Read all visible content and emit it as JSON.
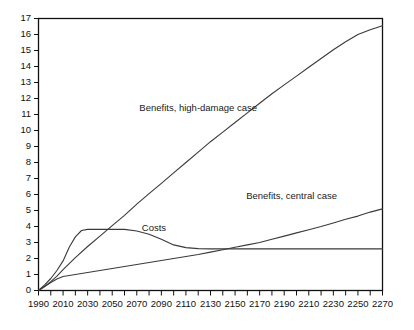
{
  "chart_data": {
    "type": "line",
    "title": "",
    "xlabel": "",
    "ylabel": "",
    "xlim": [
      1990,
      2270
    ],
    "ylim": [
      0,
      17
    ],
    "grid": false,
    "legend_position": "inline-annotations",
    "y_ticks": [
      0,
      1,
      2,
      3,
      4,
      5,
      6,
      7,
      8,
      9,
      10,
      11,
      12,
      13,
      14,
      15,
      16,
      17
    ],
    "y_tick_labels": [
      "0",
      "1",
      "2",
      "3",
      "4",
      "5",
      "6",
      "7",
      "8",
      "9",
      "10",
      "11",
      "12",
      "13",
      "14",
      "15",
      "16",
      "17"
    ],
    "x_ticks": [
      1990,
      2000,
      2010,
      2020,
      2030,
      2040,
      2050,
      2060,
      2070,
      2080,
      2090,
      2100,
      2110,
      2120,
      2130,
      2140,
      2150,
      2160,
      2170,
      2180,
      2190,
      2200,
      2210,
      2220,
      2230,
      2240,
      2250,
      2260,
      2270
    ],
    "x_tick_labels_shown": [
      "1990",
      "2010",
      "2030",
      "2050",
      "2070",
      "2090",
      "2110",
      "2130",
      "2150",
      "2170",
      "2190",
      "2210",
      "2230",
      "2250",
      "2270"
    ],
    "x_labeled_ticks": [
      1990,
      2010,
      2030,
      2050,
      2070,
      2090,
      2110,
      2130,
      2150,
      2170,
      2190,
      2210,
      2230,
      2250,
      2270
    ],
    "series": [
      {
        "name": "Benefits, high-damage case",
        "label_text": "Benefits, high-damage case",
        "label_x": 2120,
        "label_y": 11.2,
        "color": "#3a3a3a",
        "x": [
          1990,
          1995,
          2000,
          2005,
          2010,
          2020,
          2030,
          2040,
          2050,
          2060,
          2070,
          2080,
          2090,
          2100,
          2110,
          2120,
          2130,
          2140,
          2150,
          2160,
          2170,
          2180,
          2190,
          2200,
          2210,
          2220,
          2230,
          2240,
          2250,
          2260,
          2270
        ],
        "y": [
          0.0,
          0.25,
          0.55,
          0.9,
          1.3,
          2.05,
          2.75,
          3.4,
          4.05,
          4.7,
          5.4,
          6.05,
          6.7,
          7.35,
          8.0,
          8.65,
          9.3,
          9.9,
          10.5,
          11.1,
          11.7,
          12.3,
          12.85,
          13.4,
          13.95,
          14.5,
          15.05,
          15.55,
          16.0,
          16.3,
          16.55
        ]
      },
      {
        "name": "Costs",
        "label_text": "Costs",
        "label_x": 2084,
        "label_y": 3.75,
        "color": "#3a3a3a",
        "x": [
          1990,
          1995,
          2000,
          2005,
          2010,
          2015,
          2020,
          2025,
          2030,
          2040,
          2050,
          2060,
          2070,
          2080,
          2090,
          2100,
          2110,
          2120,
          2130,
          2150,
          2170,
          2190,
          2210,
          2230,
          2250,
          2270
        ],
        "y": [
          0.0,
          0.35,
          0.75,
          1.25,
          1.85,
          2.7,
          3.35,
          3.75,
          3.82,
          3.82,
          3.82,
          3.82,
          3.72,
          3.52,
          3.2,
          2.85,
          2.68,
          2.62,
          2.6,
          2.6,
          2.6,
          2.6,
          2.6,
          2.6,
          2.6,
          2.6
        ]
      },
      {
        "name": "Benefits, central case",
        "label_text": "Benefits, central case",
        "label_x": 2196,
        "label_y": 5.75,
        "color": "#3a3a3a",
        "x": [
          1990,
          1995,
          2000,
          2005,
          2010,
          2020,
          2030,
          2040,
          2050,
          2060,
          2070,
          2080,
          2090,
          2100,
          2110,
          2120,
          2130,
          2140,
          2150,
          2160,
          2170,
          2180,
          2190,
          2200,
          2210,
          2220,
          2230,
          2240,
          2250,
          2260,
          2270
        ],
        "y": [
          0.0,
          0.25,
          0.5,
          0.72,
          0.88,
          1.0,
          1.12,
          1.25,
          1.38,
          1.5,
          1.62,
          1.75,
          1.88,
          2.0,
          2.12,
          2.25,
          2.4,
          2.55,
          2.7,
          2.85,
          3.0,
          3.2,
          3.4,
          3.6,
          3.8,
          4.0,
          4.22,
          4.45,
          4.65,
          4.9,
          5.1
        ]
      }
    ]
  }
}
